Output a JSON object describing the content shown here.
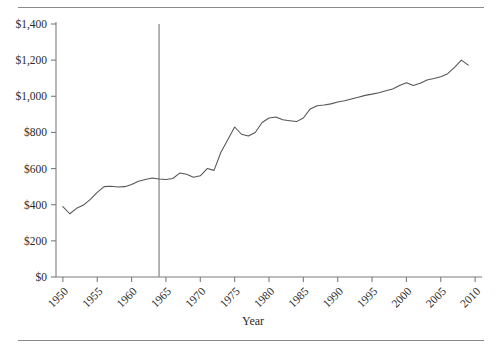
{
  "chart_data": {
    "type": "line",
    "title": "",
    "xlabel": "Year",
    "ylabel": "",
    "xlim": [
      1949,
      2011
    ],
    "ylim": [
      0,
      1400
    ],
    "grid": false,
    "legend": null,
    "ytick_labels": [
      "$0",
      "$200",
      "$400",
      "$600",
      "$800",
      "$1,000",
      "$1,200",
      "$1,400"
    ],
    "ytick_values": [
      0,
      200,
      400,
      600,
      800,
      1000,
      1200,
      1400
    ],
    "xtick_labels": [
      "1950",
      "1955",
      "1960",
      "1965",
      "1970",
      "1975",
      "1980",
      "1985",
      "1990",
      "1995",
      "2000",
      "2005",
      "2010"
    ],
    "xtick_values": [
      1950,
      1955,
      1960,
      1965,
      1970,
      1975,
      1980,
      1985,
      1990,
      1995,
      2000,
      2005,
      2010
    ],
    "annotations": [
      {
        "type": "vertical-line",
        "x": 1964,
        "label": ""
      }
    ],
    "series": [
      {
        "name": "value",
        "x": [
          1950,
          1951,
          1952,
          1953,
          1954,
          1955,
          1956,
          1957,
          1958,
          1959,
          1960,
          1961,
          1962,
          1963,
          1964,
          1965,
          1966,
          1967,
          1968,
          1969,
          1970,
          1971,
          1972,
          1973,
          1974,
          1975,
          1976,
          1977,
          1978,
          1979,
          1980,
          1981,
          1982,
          1983,
          1984,
          1985,
          1986,
          1987,
          1988,
          1989,
          1990,
          1991,
          1992,
          1993,
          1994,
          1995,
          1996,
          1997,
          1998,
          1999,
          2000,
          2001,
          2002,
          2003,
          2004,
          2005,
          2006,
          2007,
          2008,
          2009
        ],
        "values": [
          390,
          350,
          380,
          398,
          430,
          468,
          500,
          502,
          498,
          500,
          512,
          530,
          540,
          548,
          542,
          540,
          545,
          575,
          568,
          552,
          560,
          600,
          590,
          690,
          760,
          830,
          790,
          780,
          800,
          855,
          880,
          885,
          870,
          865,
          860,
          880,
          930,
          948,
          952,
          958,
          968,
          975,
          985,
          995,
          1005,
          1012,
          1020,
          1030,
          1040,
          1060,
          1075,
          1060,
          1072,
          1090,
          1098,
          1108,
          1125,
          1160,
          1200,
          1172
        ]
      }
    ]
  },
  "axis": {
    "x_title": "Year"
  }
}
